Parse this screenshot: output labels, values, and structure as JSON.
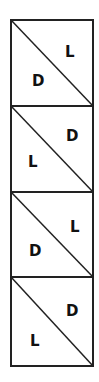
{
  "diagram": {
    "title": "",
    "frame": {
      "x": 11,
      "y": 20,
      "width": 83,
      "height": 346
    },
    "stroke_color": "#222222",
    "cells": [
      {
        "upper_label": "L",
        "lower_label": "D"
      },
      {
        "upper_label": "D",
        "lower_label": "L"
      },
      {
        "upper_label": "L",
        "lower_label": "D"
      },
      {
        "upper_label": "D",
        "lower_label": "L"
      }
    ]
  }
}
